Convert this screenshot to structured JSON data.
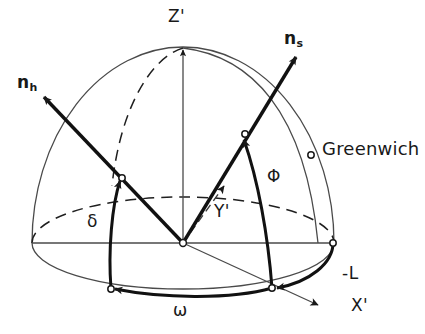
{
  "figure": {
    "background_color": "#ffffff",
    "ink_color": "#191919"
  },
  "labels": {
    "z_axis": "Z'",
    "x_axis": "X'",
    "y_axis": "Y'",
    "vector_h_base": "n",
    "vector_h_sub": "h",
    "vector_s_base": "n",
    "vector_s_sub": "s",
    "angle_delta": "δ",
    "angle_omega": "ω",
    "angle_phi": "Φ",
    "longitude_minus_L": "-L",
    "greenwich": "Greenwich"
  },
  "markers": {
    "origin": "sphere-center",
    "greenwich_point": "greenwich-marker",
    "equator_right": "equator-right-marker",
    "n_h_surface": "n-h-surface-marker",
    "n_s_surface": "n-s-surface-marker",
    "omega_arc_end": "omega-arc-end-marker",
    "x_axis_intersection": "x-axis-surface-marker"
  },
  "geometry": {
    "sphere_center_x": 183,
    "sphere_center_y": 243,
    "sphere_radius_x": 151,
    "sphere_radius_y": 151,
    "equator_ellipse_ry": 46,
    "z_axis_top_y": 48,
    "z_axis_base_y": 243
  },
  "icons": {
    "arrowhead": "arrowhead-icon",
    "open_circle": "open-circle-marker-icon"
  }
}
